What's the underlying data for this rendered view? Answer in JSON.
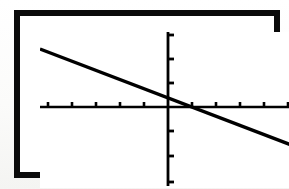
{
  "screen": {
    "device": "graphing-calculator-screen",
    "frame_color": "#0b0b0b",
    "screen_background": "#ffffff",
    "ink_color": "#000000",
    "frame_thickness_px": 6
  },
  "chart_data": {
    "type": "line",
    "title": "",
    "subtitle": "",
    "xlabel": "",
    "ylabel": "",
    "grid": false,
    "legend": null,
    "axes": {
      "x_axis_visible": true,
      "y_axis_visible": true,
      "x_origin_px": 128,
      "y_origin_px": 75,
      "tick_spacing_px": 24,
      "tick_length_px": 5,
      "xlim": [
        -5.3,
        5.2
      ],
      "ylim": [
        -3.5,
        3.1
      ],
      "x_tick_values": [
        -5,
        -4,
        -3,
        -2,
        -1,
        1,
        2,
        3,
        4,
        5
      ],
      "y_tick_values": [
        -3,
        -2,
        -1,
        1,
        2,
        3
      ],
      "x_tick_labels": [],
      "y_tick_labels": []
    },
    "series": [
      {
        "name": "line",
        "equation": "y = -0.38x + 0.16",
        "slope": -0.38,
        "intercept": 0.16,
        "x_intercept": 0.42,
        "stroke": "#000000",
        "stroke_width_px": 3.4,
        "x": [
          -5.3,
          5.2
        ],
        "values": [
          2.17,
          -1.82
        ],
        "points_px": [
          {
            "x": 0,
            "y": 17
          },
          {
            "x": 254,
            "y": 114
          }
        ]
      }
    ],
    "annotations": []
  },
  "ticks": {
    "x_positions_px": [
      8,
      32,
      56,
      80,
      104,
      152,
      176,
      200,
      224,
      248
    ],
    "y_positions_px": [
      3,
      27,
      51,
      99,
      124,
      150
    ]
  }
}
